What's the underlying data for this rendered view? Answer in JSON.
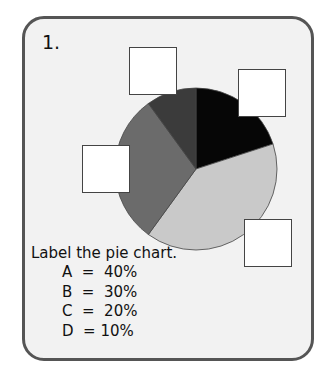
{
  "question": {
    "number": "1.",
    "instruction": "Label the pie chart."
  },
  "chart_data": {
    "type": "pie",
    "title": "",
    "center": [
      196,
      169
    ],
    "radius": 81,
    "start_angle_deg": 0,
    "direction": "clockwise",
    "slices": [
      {
        "label": "C",
        "value": 20,
        "color": "#060606",
        "position": "top-right"
      },
      {
        "label": "A",
        "value": 40,
        "color": "#c9c9c9",
        "position": "bottom-right"
      },
      {
        "label": "B",
        "value": 30,
        "color": "#6b6b6b",
        "position": "left"
      },
      {
        "label": "D",
        "value": 10,
        "color": "#3b3b3b",
        "position": "top-left"
      }
    ],
    "labels_shown": false,
    "legend": [
      "A = 40%",
      "B = 30%",
      "C = 20%",
      "D = 10%"
    ]
  },
  "legend": {
    "rows": [
      "A  =  40%",
      "B  =  30%",
      "C  =  20%",
      "D  = 10%"
    ]
  },
  "answer_boxes": [
    {
      "name": "top-left",
      "x": 129,
      "y": 47,
      "value": ""
    },
    {
      "name": "top-right",
      "x": 238,
      "y": 69,
      "value": ""
    },
    {
      "name": "left",
      "x": 82,
      "y": 145,
      "value": ""
    },
    {
      "name": "bottom-right",
      "x": 244,
      "y": 219,
      "value": ""
    }
  ]
}
